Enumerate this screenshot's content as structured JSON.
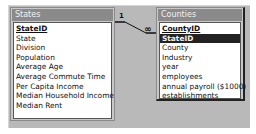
{
  "diagram": {
    "tables": [
      {
        "name": "States",
        "fields": [
          {
            "label": "StateID",
            "primary_key": true
          },
          {
            "label": "State"
          },
          {
            "label": "Division"
          },
          {
            "label": "Population"
          },
          {
            "label": "Average Age"
          },
          {
            "label": "Average Commute Time"
          },
          {
            "label": "Per Capita Income"
          },
          {
            "label": "Median Household Income"
          },
          {
            "label": "Median Rent"
          }
        ]
      },
      {
        "name": "Counties",
        "fields": [
          {
            "label": "CountyID",
            "primary_key": true
          },
          {
            "label": "StateID",
            "selected": true
          },
          {
            "label": "County"
          },
          {
            "label": "Industry"
          },
          {
            "label": "year"
          },
          {
            "label": "employees"
          },
          {
            "label": "annual payroll ($1000)"
          },
          {
            "label": "establishments"
          }
        ]
      }
    ],
    "relationship": {
      "from_table": "States",
      "from_field": "StateID",
      "to_table": "Counties",
      "to_field": "StateID",
      "one_label": "1",
      "many_label": "∞"
    }
  }
}
